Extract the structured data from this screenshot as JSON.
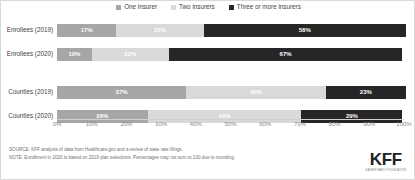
{
  "legend": {
    "entries": [
      {
        "label": "One insurer",
        "color": "#a6a6a6",
        "icon": "square-swatch-icon"
      },
      {
        "label": "Two insurers",
        "color": "#d9d9d9",
        "icon": "square-swatch-icon"
      },
      {
        "label": "Three or more insurers",
        "color": "#262626",
        "icon": "square-swatch-icon"
      }
    ]
  },
  "axis": {
    "ticks": [
      "0%",
      "10%",
      "20%",
      "30%",
      "40%",
      "50%",
      "60%",
      "70%",
      "80%",
      "90%",
      "100%"
    ]
  },
  "rows": [
    {
      "label": "Enrollees (2019)",
      "segments": [
        {
          "label": "17%",
          "value": 17
        },
        {
          "label": "25%",
          "value": 25
        },
        {
          "label": "58%",
          "value": 58
        }
      ]
    },
    {
      "label": "Enrollees (2020)",
      "segments": [
        {
          "label": "10%",
          "value": 10
        },
        {
          "label": "22%",
          "value": 22
        },
        {
          "label": "67%",
          "value": 67
        }
      ]
    },
    {
      "label": "Counties (2019)",
      "segments": [
        {
          "label": "37%",
          "value": 37
        },
        {
          "label": "40%",
          "value": 40
        },
        {
          "label": "23%",
          "value": 23
        }
      ]
    },
    {
      "label": "Counties (2020)",
      "segments": [
        {
          "label": "26%",
          "value": 26
        },
        {
          "label": "44%",
          "value": 44
        },
        {
          "label": "29%",
          "value": 29
        }
      ]
    }
  ],
  "footer": {
    "source": "SOURCE:  KFF analysis of data from Healthcare.gov and a review of state rate filings.",
    "note": "NOTE:  Enrollment in 2020 is based on 2019 plan selections.  Percentages may not sum to 100 due to rounding."
  },
  "logo": {
    "mark": "KFF",
    "sub": "KAISER FAMILY FOUNDATION"
  },
  "chart_data": {
    "type": "bar",
    "orientation": "horizontal",
    "stacked": true,
    "normalized": true,
    "title": "",
    "xlabel": "",
    "ylabel": "",
    "xlim": [
      0,
      100
    ],
    "grid": false,
    "legend_position": "top-center",
    "categories": [
      "Enrollees (2019)",
      "Enrollees (2020)",
      "Counties (2019)",
      "Counties (2020)"
    ],
    "series": [
      {
        "name": "One insurer",
        "color": "#a6a6a6",
        "values": [
          17,
          10,
          37,
          26
        ]
      },
      {
        "name": "Two insurers",
        "color": "#d9d9d9",
        "values": [
          25,
          22,
          40,
          44
        ]
      },
      {
        "name": "Three or more insurers",
        "color": "#262626",
        "values": [
          58,
          67,
          23,
          29
        ]
      }
    ],
    "tick_labels": [
      "0%",
      "10%",
      "20%",
      "30%",
      "40%",
      "50%",
      "60%",
      "70%",
      "80%",
      "90%",
      "100%"
    ],
    "annotations": [
      "SOURCE:  KFF analysis of data from Healthcare.gov and a review of state rate filings.",
      "NOTE:  Enrollment in 2020 is based on 2019 plan selections.  Percentages may not sum to 100 due to rounding."
    ]
  }
}
